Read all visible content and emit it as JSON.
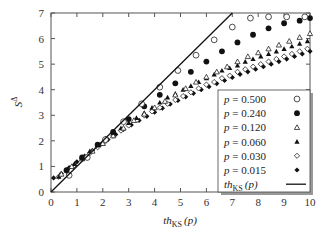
{
  "chart_data": {
    "type": "scatter",
    "title": "",
    "xlabel": "th_KS (p)",
    "xlabel_main": "th",
    "xlabel_sub": "KS",
    "xlabel_arg": "(p)",
    "ylabel": "S^Δ",
    "ylabel_main": "S",
    "ylabel_sup": "Δ",
    "xlim": [
      0,
      10
    ],
    "ylim": [
      0,
      7
    ],
    "xticks": [
      0,
      1,
      2,
      3,
      4,
      5,
      6,
      7,
      8,
      9,
      10
    ],
    "yticks": [
      0,
      1,
      2,
      3,
      4,
      5,
      6,
      7
    ],
    "grid": false,
    "legend_position": "lower right (inside)",
    "series": [
      {
        "name": "p = 0.500",
        "marker": "open-circle",
        "x": [
          0.7,
          1.4,
          2.1,
          2.8,
          3.5,
          4.2,
          4.9,
          5.6,
          6.3,
          7.0,
          7.7,
          8.4,
          9.1,
          9.8
        ],
        "y": [
          0.65,
          1.35,
          2.05,
          2.75,
          3.45,
          4.1,
          4.75,
          5.35,
          5.95,
          6.45,
          6.8,
          6.85,
          6.85,
          6.85
        ]
      },
      {
        "name": "p = 0.240",
        "marker": "filled-circle",
        "x": [
          0.6,
          1.2,
          1.8,
          2.4,
          3.0,
          3.6,
          4.2,
          4.8,
          5.4,
          6.0,
          6.6,
          7.2,
          7.8,
          8.4,
          9.0,
          9.6,
          10.0
        ],
        "y": [
          0.85,
          1.35,
          1.85,
          2.35,
          2.85,
          3.35,
          3.8,
          4.25,
          4.7,
          5.1,
          5.5,
          5.85,
          6.15,
          6.4,
          6.6,
          6.7,
          6.8
        ]
      },
      {
        "name": "p = 0.120",
        "marker": "open-triangle",
        "x": [
          0.4,
          0.8,
          1.2,
          1.6,
          2.0,
          2.4,
          2.8,
          3.2,
          3.6,
          4.0,
          4.4,
          4.8,
          5.2,
          5.6,
          6.0,
          6.4,
          6.8,
          7.2,
          7.6,
          8.0,
          8.4,
          8.8,
          9.2,
          9.6,
          10.0
        ],
        "y": [
          0.7,
          1.0,
          1.3,
          1.6,
          1.9,
          2.2,
          2.5,
          2.8,
          3.05,
          3.3,
          3.55,
          3.8,
          4.05,
          4.3,
          4.5,
          4.7,
          4.9,
          5.1,
          5.3,
          5.45,
          5.6,
          5.75,
          5.9,
          6.05,
          6.2
        ]
      },
      {
        "name": "p = 0.060",
        "marker": "filled-triangle",
        "x": [
          0.3,
          0.6,
          0.9,
          1.2,
          1.5,
          1.8,
          2.1,
          2.4,
          2.7,
          3.0,
          3.3,
          3.6,
          3.9,
          4.2,
          4.5,
          4.8,
          5.1,
          5.4,
          5.7,
          6.0,
          6.3,
          6.6,
          6.9,
          7.2,
          7.5,
          7.8,
          8.1,
          8.4,
          8.7,
          9.0,
          9.3,
          9.6,
          9.9
        ],
        "y": [
          0.6,
          0.85,
          1.1,
          1.35,
          1.6,
          1.85,
          2.1,
          2.3,
          2.5,
          2.7,
          2.9,
          3.1,
          3.3,
          3.5,
          3.7,
          3.85,
          4.0,
          4.15,
          4.3,
          4.45,
          4.6,
          4.75,
          4.85,
          4.95,
          5.1,
          5.2,
          5.3,
          5.4,
          5.5,
          5.6,
          5.7,
          5.8,
          5.9
        ]
      },
      {
        "name": "p = 0.030",
        "marker": "open-diamond",
        "x": [
          0.3,
          0.6,
          0.9,
          1.2,
          1.5,
          1.8,
          2.1,
          2.4,
          2.7,
          3.0,
          3.3,
          3.6,
          3.9,
          4.2,
          4.5,
          4.8,
          5.1,
          5.4,
          5.7,
          6.0,
          6.3,
          6.6,
          6.9,
          7.2,
          7.5,
          7.8,
          8.1,
          8.4,
          8.7,
          9.0,
          9.3,
          9.6,
          9.9
        ],
        "y": [
          0.6,
          0.82,
          1.05,
          1.3,
          1.52,
          1.75,
          1.98,
          2.2,
          2.4,
          2.6,
          2.8,
          3.0,
          3.15,
          3.3,
          3.45,
          3.6,
          3.75,
          3.9,
          4.05,
          4.2,
          4.3,
          4.45,
          4.55,
          4.7,
          4.8,
          4.9,
          5.0,
          5.1,
          5.2,
          5.3,
          5.4,
          5.5,
          5.6
        ]
      },
      {
        "name": "p = 0.015",
        "marker": "filled-diamond",
        "x": [
          0.1,
          0.4,
          0.7,
          1.0,
          1.3,
          1.6,
          1.9,
          2.2,
          2.5,
          2.8,
          3.1,
          3.4,
          3.7,
          4.0,
          4.3,
          4.6,
          4.9,
          5.2,
          5.5,
          5.8,
          6.1,
          6.4,
          6.7,
          7.0,
          7.3,
          7.6,
          7.9,
          8.2,
          8.5,
          8.8,
          9.1,
          9.4,
          9.7,
          10.0
        ],
        "y": [
          0.55,
          0.72,
          0.95,
          1.18,
          1.4,
          1.62,
          1.84,
          2.05,
          2.25,
          2.45,
          2.62,
          2.8,
          2.96,
          3.12,
          3.28,
          3.44,
          3.58,
          3.72,
          3.86,
          4.0,
          4.12,
          4.24,
          4.36,
          4.48,
          4.6,
          4.7,
          4.8,
          4.9,
          5.0,
          5.1,
          5.2,
          5.3,
          5.4,
          5.5
        ]
      },
      {
        "name": "th_KS (p)",
        "marker": "line",
        "x": [
          0,
          7.0
        ],
        "y": [
          0,
          7.0
        ]
      }
    ]
  },
  "legend": {
    "items": [
      {
        "label": "p = 0.500",
        "marker": "open-circle"
      },
      {
        "label": "p = 0.240",
        "marker": "filled-circle"
      },
      {
        "label": "p = 0.120",
        "marker": "open-triangle"
      },
      {
        "label": "p = 0.060",
        "marker": "filled-triangle"
      },
      {
        "label": "p = 0.030",
        "marker": "open-diamond"
      },
      {
        "label": "p = 0.015",
        "marker": "filled-diamond"
      }
    ],
    "line_item": {
      "main": "th",
      "sub": "KS",
      "arg": "(p)"
    }
  }
}
